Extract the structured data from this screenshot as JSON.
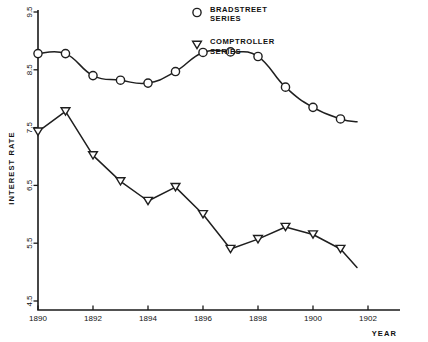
{
  "chart_data": {
    "type": "line",
    "title": "",
    "xlabel": "YEAR",
    "ylabel": "INTEREST RATE",
    "xlim": [
      1890,
      1902
    ],
    "ylim": [
      4.5,
      9.5
    ],
    "grid": false,
    "legend_position": "top-right",
    "x": [
      1890,
      1891,
      1892,
      1893,
      1894,
      1895,
      1896,
      1897,
      1898,
      1899,
      1900,
      1901
    ],
    "xticks": [
      "1890",
      "1892",
      "1894",
      "1896",
      "1898",
      "1900",
      "1902"
    ],
    "xtick_values": [
      1890,
      1892,
      1894,
      1896,
      1898,
      1900,
      1902
    ],
    "yticks": [
      "9.5",
      "8.5",
      "7.5",
      "6.5",
      "5.5",
      "4.5"
    ],
    "ytick_values": [
      9.5,
      8.5,
      7.5,
      6.5,
      5.5,
      4.5
    ],
    "series": [
      {
        "name": "BRADSTREET SERIES",
        "marker": "circle",
        "values": [
          8.78,
          8.78,
          8.4,
          8.32,
          8.27,
          8.47,
          8.8,
          8.81,
          8.73,
          8.2,
          7.85,
          7.65
        ]
      },
      {
        "name": "COMPTROLLER SERIES",
        "marker": "triangle-down",
        "values": [
          7.43,
          7.78,
          7.02,
          6.57,
          6.23,
          6.47,
          6.0,
          5.4,
          5.57,
          5.78,
          5.65,
          5.4
        ]
      }
    ],
    "series_tail_notes": {
      "bradstreet_end_x": 1901.6,
      "bradstreet_end_y": 7.6,
      "comptroller_end_x": 1901.6,
      "comptroller_end_y": 5.08
    }
  },
  "legend": {
    "entries": [
      {
        "marker_name": "circle-marker-icon",
        "label_line1": "BRADSTREET",
        "label_line2": "SERIES"
      },
      {
        "marker_name": "triangle-down-marker-icon",
        "label_line1": "COMPTROLLER",
        "label_line2": "SERIES"
      }
    ]
  },
  "axes": {
    "y_title": "INTEREST RATE",
    "x_title": "YEAR"
  },
  "colors": {
    "ink": "#1f1f1f",
    "background": "#ffffff"
  }
}
